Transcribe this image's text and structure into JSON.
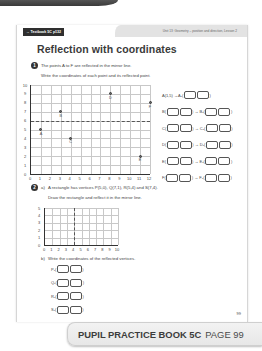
{
  "header": {
    "textbook_ref": "→ Textbook 5C p132",
    "unit": "Unit 13: Geometry – position and direction, Lesson 2"
  },
  "title": "Reflection with coordinates",
  "question1": {
    "number": "1",
    "line1": "The points A to F are reflected in the mirror line.",
    "line2": "Write the coordinates of each point and its reflected point.",
    "grid": {
      "x_ticks": [
        "0",
        "1",
        "2",
        "3",
        "4",
        "5",
        "6",
        "7",
        "8",
        "9",
        "10",
        "11",
        "12"
      ],
      "y_ticks": [
        "0",
        "1",
        "2",
        "3",
        "4",
        "5",
        "6",
        "7",
        "8",
        "9",
        "10"
      ],
      "mirror_y": 6,
      "points": [
        {
          "label": "A",
          "x": 1,
          "y": 5
        },
        {
          "label": "B",
          "x": 3,
          "y": 7
        },
        {
          "label": "C",
          "x": 4,
          "y": 4
        },
        {
          "label": "D",
          "x": 8,
          "y": 9
        },
        {
          "label": "E",
          "x": 11,
          "y": 2
        },
        {
          "label": "F",
          "x": 12,
          "y": 8
        }
      ]
    },
    "answers": [
      {
        "left": "A(1,5) →",
        "right": "A₁("
      },
      {
        "left": "B(",
        "right": "→ B₁("
      },
      {
        "left": "C(",
        "right": "→ C₁("
      },
      {
        "left": "D(",
        "right": "→ D₁("
      },
      {
        "left": "E(",
        "right": "→ E₁("
      },
      {
        "left": "F(",
        "right": "→ F₁("
      }
    ],
    "close": ")"
  },
  "question2": {
    "number": "2",
    "part_a_label": "a)",
    "part_a_text": "A rectangle has vertices P(5,0), Q(7,1), R(5,4) and S(7,4).",
    "part_a_instruction": "Draw the rectangle and reflect it in the mirror line.",
    "grid": {
      "x_ticks": [
        "0",
        "1",
        "2",
        "3",
        "4",
        "5",
        "6",
        "7",
        "8",
        "9",
        "10"
      ],
      "y_ticks": [
        "0",
        "1",
        "2",
        "3",
        "4",
        "5"
      ],
      "mirror_x": 4
    },
    "part_b_label": "b)",
    "part_b_text": "Write the coordinates of the reflected vertices.",
    "vertices": [
      "P₁(",
      "Q₁(",
      "R₁(",
      "S₁("
    ],
    "close": ")"
  },
  "page_number": "99",
  "banner": {
    "book": "PUPIL PRACTICE BOOK 5C",
    "page": "PAGE 99"
  }
}
